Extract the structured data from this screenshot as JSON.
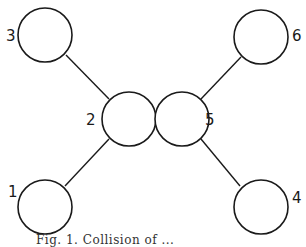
{
  "diagram": {
    "stroke_color": "#1a1a1a",
    "background": "#ffffff",
    "nodes": [
      {
        "id": "1",
        "label": "1",
        "cx": 45,
        "cy": 207,
        "r": 27,
        "lx": 8,
        "ly": 197
      },
      {
        "id": "2",
        "label": "2",
        "cx": 129,
        "cy": 119,
        "r": 27,
        "lx": 86,
        "ly": 125
      },
      {
        "id": "3",
        "label": "3",
        "cx": 45,
        "cy": 35,
        "r": 27,
        "lx": 6,
        "ly": 41
      },
      {
        "id": "4",
        "label": "4",
        "cx": 261,
        "cy": 207,
        "r": 27,
        "lx": 292,
        "ly": 203
      },
      {
        "id": "5",
        "label": "5",
        "cx": 182,
        "cy": 119,
        "r": 27,
        "lx": 205,
        "ly": 125
      },
      {
        "id": "6",
        "label": "6",
        "cx": 261,
        "cy": 37,
        "r": 27,
        "lx": 292,
        "ly": 41
      }
    ],
    "edges": [
      {
        "from": "3",
        "to": "2",
        "x1": 66,
        "y1": 55,
        "x2": 109,
        "y2": 99
      },
      {
        "from": "1",
        "to": "2",
        "x1": 65,
        "y1": 186,
        "x2": 109,
        "y2": 139
      },
      {
        "from": "6",
        "to": "5",
        "x1": 241,
        "y1": 57,
        "x2": 201,
        "y2": 99
      },
      {
        "from": "4",
        "to": "5",
        "x1": 240,
        "y1": 186,
        "x2": 201,
        "y2": 139
      }
    ],
    "caption": "Fig. 1. Collision of ..."
  }
}
